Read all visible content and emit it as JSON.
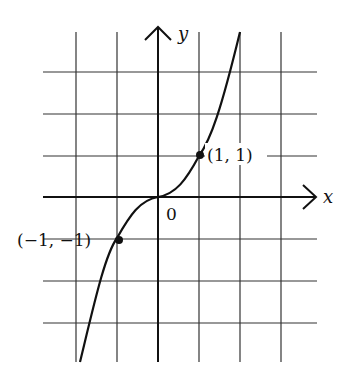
{
  "diagram": {
    "function": "y = x^3",
    "axes": {
      "x_label": "x",
      "y_label": "y",
      "origin_label": "0"
    },
    "points": [
      {
        "label": "(1, 1)",
        "x": 1,
        "y": 1
      },
      {
        "label": "(-1, -1)",
        "display": "(−1, −1)",
        "x": -1,
        "y": -1
      }
    ],
    "grid": {
      "x_range": [
        -2.8,
        3.9
      ],
      "y_range": [
        -4,
        4
      ],
      "unit": 1
    },
    "colors": {
      "line": "#111111",
      "grid": "#333333",
      "background": "#ffffff"
    }
  }
}
